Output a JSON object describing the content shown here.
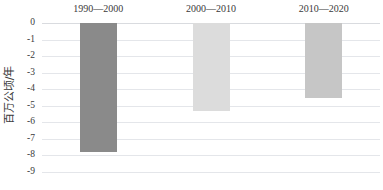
{
  "chart_data": {
    "type": "bar",
    "title": "",
    "subtitle": "",
    "xlabel": "",
    "ylabel": "百万公顷/年",
    "categories": [
      "1990—2000",
      "2000—2010",
      "2010—2020"
    ],
    "values": [
      -7.8,
      -5.3,
      -4.55
    ],
    "series": [
      {
        "name": "年均森林净变化",
        "values": [
          -7.8,
          -5.3,
          -4.55
        ]
      }
    ],
    "bar_colors": [
      "#8a8a8a",
      "#dcdcdc",
      "#c6c6c6"
    ],
    "ylim": [
      -9,
      0
    ],
    "ytick_labels": [
      "0",
      "-1",
      "-2",
      "-3",
      "-4",
      "-5",
      "-6",
      "-7",
      "-8",
      "-9"
    ],
    "ytick_values": [
      0,
      -1,
      -2,
      -3,
      -4,
      -5,
      -6,
      -7,
      -8,
      -9
    ],
    "grid": true,
    "grid_color": "#e4e6ea",
    "legend": false,
    "legend_position": "none",
    "category_labels_position": "top",
    "annotations": []
  },
  "colors": {
    "background": "#ffffff",
    "text": "#3a3a3a",
    "gridline": "#e4e6ea",
    "zero_line": "#d9dbdf"
  }
}
